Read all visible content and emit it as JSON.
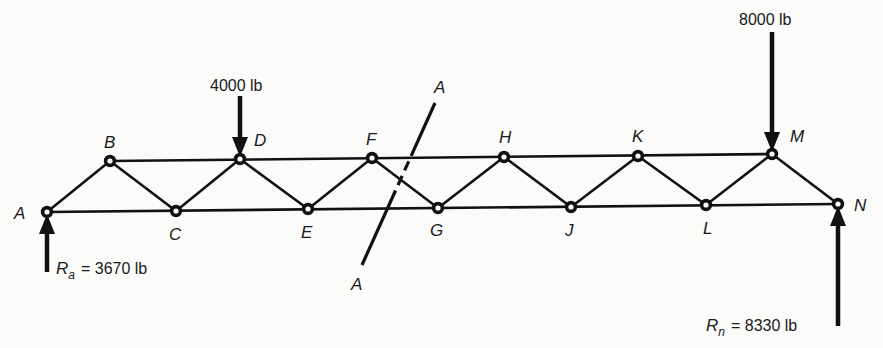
{
  "diagram": {
    "type": "truss",
    "nodes": [
      {
        "id": "A",
        "x": 47,
        "y": 212,
        "label": "A",
        "lx": 14,
        "ly": 219
      },
      {
        "id": "B",
        "x": 110,
        "y": 161,
        "label": "B",
        "lx": 104,
        "ly": 148
      },
      {
        "id": "C",
        "x": 176,
        "y": 211,
        "label": "C",
        "lx": 169,
        "ly": 240
      },
      {
        "id": "D",
        "x": 240,
        "y": 159,
        "label": "D",
        "lx": 254,
        "ly": 146
      },
      {
        "id": "E",
        "x": 308,
        "y": 209,
        "label": "E",
        "lx": 301,
        "ly": 238
      },
      {
        "id": "F",
        "x": 372,
        "y": 158,
        "label": "F",
        "lx": 366,
        "ly": 145
      },
      {
        "id": "G",
        "x": 438,
        "y": 208,
        "label": "G",
        "lx": 430,
        "ly": 236
      },
      {
        "id": "H",
        "x": 504,
        "y": 157,
        "label": "H",
        "lx": 499,
        "ly": 143
      },
      {
        "id": "J",
        "x": 571,
        "y": 207,
        "label": "J",
        "lx": 565,
        "ly": 236
      },
      {
        "id": "K",
        "x": 638,
        "y": 156,
        "label": "K",
        "lx": 632,
        "ly": 142
      },
      {
        "id": "L",
        "x": 706,
        "y": 205,
        "label": "L",
        "lx": 703,
        "ly": 234
      },
      {
        "id": "M",
        "x": 772,
        "y": 154,
        "label": "M",
        "lx": 790,
        "ly": 142
      },
      {
        "id": "N",
        "x": 838,
        "y": 204,
        "label": "N",
        "lx": 854,
        "ly": 211
      }
    ],
    "members": [
      [
        "A",
        "B"
      ],
      [
        "B",
        "C"
      ],
      [
        "C",
        "D"
      ],
      [
        "D",
        "E"
      ],
      [
        "E",
        "F"
      ],
      [
        "F",
        "G"
      ],
      [
        "G",
        "H"
      ],
      [
        "H",
        "J"
      ],
      [
        "J",
        "K"
      ],
      [
        "K",
        "L"
      ],
      [
        "L",
        "M"
      ],
      [
        "M",
        "N"
      ],
      [
        "B",
        "M"
      ],
      [
        "A",
        "N"
      ]
    ],
    "loads": [
      {
        "node": "D",
        "label": "4000 lb",
        "direction": "down",
        "x": 240,
        "y1": 96,
        "y2": 157,
        "tx": 210,
        "ty": 91
      },
      {
        "node": "M",
        "label": "8000 lb",
        "direction": "down",
        "x": 772,
        "y1": 32,
        "y2": 152,
        "tx": 739,
        "ty": 25
      }
    ],
    "reactions": [
      {
        "node": "A",
        "symbol": "R",
        "subscript": "a",
        "value": "= 3670 lb",
        "direction": "up",
        "x": 47,
        "y1": 272,
        "y2": 214,
        "tx": 56,
        "ty": 274
      },
      {
        "node": "N",
        "symbol": "R",
        "subscript": "n",
        "value": "= 8330 lb",
        "direction": "up",
        "x": 838,
        "y1": 326,
        "y2": 206,
        "tx": 706,
        "ty": 331
      }
    ],
    "section_cut": {
      "name": "A-A",
      "top_label": "A",
      "bottom_label": "A",
      "x1": 435,
      "y1": 103,
      "x2": 362,
      "y2": 265,
      "top_lx": 434,
      "top_ly": 93,
      "bot_lx": 351,
      "bot_ly": 290
    }
  }
}
